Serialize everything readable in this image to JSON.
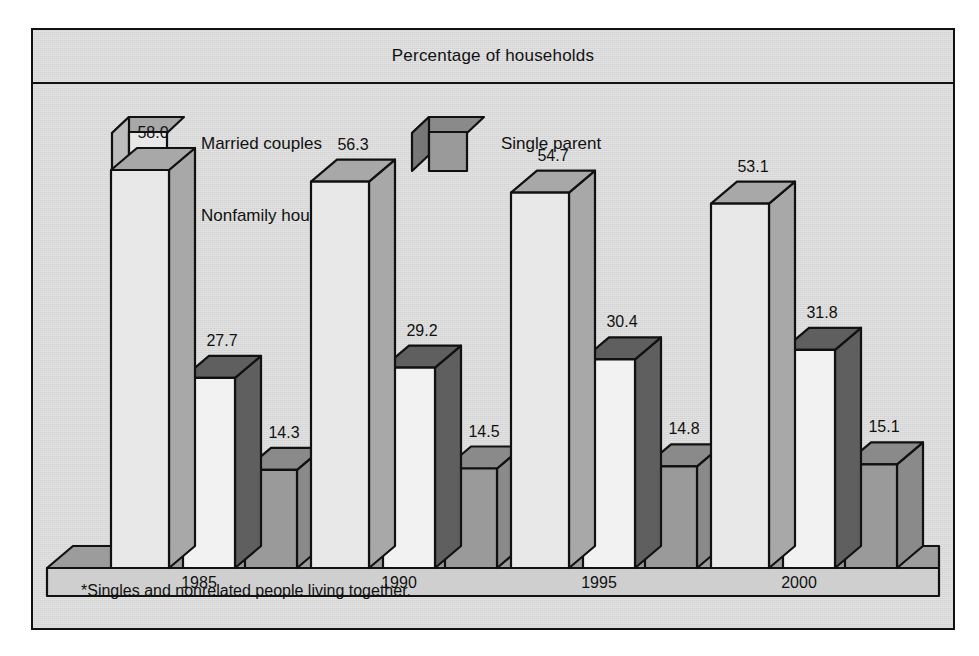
{
  "title": "Percentage of households",
  "footnote": "*Singles and nonrelated people living together.",
  "legend": [
    {
      "label": "Married couples",
      "front": "#e8e8e8",
      "top": "#a8a8a8",
      "side": "#bdbdbd"
    },
    {
      "label": "Single parent",
      "front": "#9a9a9a",
      "top": "#8a8a8a",
      "side": "#777777"
    },
    {
      "label": "Nonfamily households*",
      "front": "#f2f2f2",
      "top": "#5f5f5f",
      "side": "#4f4f4f"
    }
  ],
  "colors": {
    "background": "#d4d4d4",
    "outline": "#111111",
    "floor_top": "#c2c2c2",
    "floor_front": "#cfcfcf",
    "floor_side": "#9c9c9c",
    "married_front": "#e8e8e8",
    "married_top": "#a8a8a8",
    "nonfamily_front": "#f2f2f2",
    "nonfamily_top": "#5f5f5f",
    "single_front": "#9a9a9a",
    "single_top": "#8a8a8a"
  },
  "chart_data": {
    "type": "bar",
    "title": "Percentage of households",
    "xlabel": "",
    "ylabel": "Percentage of households",
    "ylim": [
      0,
      58
    ],
    "grid": false,
    "legend_position": "top-left",
    "categories": [
      "1985",
      "1990",
      "1995",
      "2000"
    ],
    "series": [
      {
        "name": "Married couples",
        "values": [
          58.0,
          56.3,
          54.7,
          53.1
        ]
      },
      {
        "name": "Nonfamily households*",
        "values": [
          27.7,
          29.2,
          30.4,
          31.8
        ]
      },
      {
        "name": "Single parent",
        "values": [
          14.3,
          14.5,
          14.8,
          15.1
        ]
      }
    ],
    "value_labels": [
      [
        "58.0",
        "27.7",
        "14.3"
      ],
      [
        "56.3",
        "29.2",
        "14.5"
      ],
      [
        "54.7",
        "30.4",
        "14.8"
      ],
      [
        "53.1",
        "31.8",
        "15.1"
      ]
    ],
    "annotations": [
      "*Singles and nonrelated people living together."
    ]
  }
}
